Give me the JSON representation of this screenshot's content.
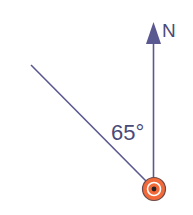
{
  "diagram": {
    "type": "bearing",
    "north_label": "N",
    "angle_label": "65°",
    "angle_degrees": 65,
    "colors": {
      "line": "#5a5890",
      "text": "#4a4a78",
      "point_fill": "#f26a3a",
      "point_ring": "#6a4a4a",
      "point_center": "#222222"
    }
  }
}
